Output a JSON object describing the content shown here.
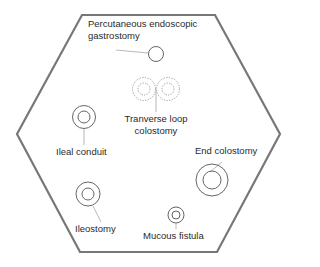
{
  "diagram": {
    "colors": {
      "outline": "#777777",
      "stroke": "#555555",
      "dashed": "#8a8a8a",
      "text": "#2a2a2a",
      "leader": "#999999"
    },
    "abdomen_outline": {
      "shape": "hexagon",
      "points": "82,15 215,15 280,134 217,252 80,252 17,134"
    },
    "stomas": [
      {
        "id": "peg",
        "label": "Percutaneous endoscopic gastrostomy",
        "label_lines": [
          "Percutaneous endoscopic",
          "gastrostomy"
        ],
        "style": "single"
      },
      {
        "id": "transverse-loop-colostomy",
        "label": "Tranverse loop colostomy",
        "label_lines": [
          "Tranverse loop",
          "colostomy"
        ],
        "style": "double-dashed"
      },
      {
        "id": "ileal-conduit",
        "label": "Ileal conduit",
        "style": "ring"
      },
      {
        "id": "end-colostomy",
        "label": "End colostomy",
        "style": "ring"
      },
      {
        "id": "ileostomy",
        "label": "Ileostomy",
        "style": "ring"
      },
      {
        "id": "mucous-fistula",
        "label": "Mucous fistula",
        "style": "ring"
      }
    ]
  },
  "labels": {
    "peg_line1": "Percutaneous endoscopic",
    "peg_line2": "gastrostomy",
    "loop_line1": "Tranverse loop",
    "loop_line2": "colostomy",
    "ileal_conduit": "Ileal conduit",
    "end_colostomy": "End colostomy",
    "ileostomy": "Ileostomy",
    "mucous_fistula": "Mucous fistula"
  }
}
